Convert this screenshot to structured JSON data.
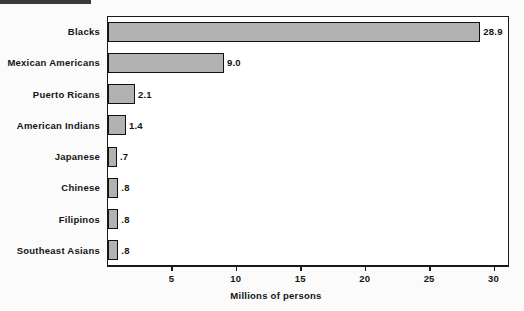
{
  "chart_data": {
    "type": "bar",
    "orientation": "horizontal",
    "title": "",
    "subtitle": "",
    "xlabel": "Millions of persons",
    "ylabel": "",
    "categories": [
      "Blacks",
      "Mexican Americans",
      "Puerto Ricans",
      "American Indians",
      "Japanese",
      "Chinese",
      "Filipinos",
      "Southeast Asians"
    ],
    "values": [
      28.9,
      9.0,
      2.1,
      1.4,
      0.7,
      0.8,
      0.8,
      0.8
    ],
    "value_labels": [
      "28.9",
      "9.0",
      "2.1",
      "1.4",
      ".7",
      ".8",
      ".8",
      ".8"
    ],
    "xlim": [
      0,
      31.2
    ],
    "xticks": [
      5,
      10,
      15,
      20,
      25,
      30
    ],
    "xtick_labels": [
      "5",
      "10",
      "15",
      "20",
      "25",
      "30"
    ],
    "grid": false,
    "legend": null,
    "bar_color": "#b2b2b2",
    "bar_edge_color": "#111111",
    "frame_color": "#1a1a1a",
    "background": "#ffffff"
  }
}
